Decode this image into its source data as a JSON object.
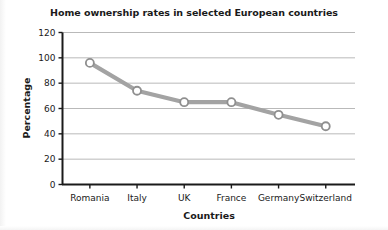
{
  "chart_data": {
    "type": "line",
    "title": "Home ownership rates in selected European countries",
    "xlabel": "Countries",
    "ylabel": "Percentage",
    "categories": [
      "Romania",
      "Italy",
      "UK",
      "France",
      "Germany",
      "Switzerland"
    ],
    "values": [
      96,
      74,
      65,
      65,
      55,
      46
    ],
    "series": [
      {
        "name": "Home ownership rate",
        "values": [
          96,
          74,
          65,
          65,
          55,
          46
        ]
      }
    ],
    "ylim": [
      0,
      120
    ],
    "ytick_labels": [
      "0",
      "20",
      "40",
      "60",
      "80",
      "100",
      "120"
    ],
    "ytick_values": [
      0,
      20,
      40,
      60,
      80,
      100,
      120
    ],
    "grid": true,
    "grid_axis": "y",
    "legend": "none",
    "marker": "open-circle",
    "line_color": "#a3a3a3",
    "marker_face_color": "#ffffff",
    "marker_edge_color": "#8f8f8f",
    "grid_color": "#b9b9b9",
    "axis_color": "#1a1a1a",
    "text_color": "#1a1a1a",
    "background_color": "#ffffff"
  }
}
